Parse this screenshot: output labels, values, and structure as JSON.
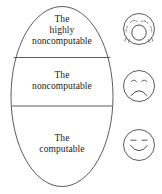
{
  "figure": {
    "stroke_color": "#4a4a4a",
    "text_color": "#1a1a1a",
    "background_color": "#ffffff"
  },
  "ellipse": {
    "bands": [
      {
        "id": "highly-noncomputable",
        "label": "The\nhighly\nnoncomputable",
        "face": "distressed-face"
      },
      {
        "id": "noncomputable",
        "label": "The\nnoncomputable",
        "face": "sad-face"
      },
      {
        "id": "computable",
        "label": "The\ncomputable",
        "face": "happy-face"
      }
    ]
  },
  "faces": {
    "top": {
      "name": "distressed-face",
      "description": "crying face with wide open mouth and tear drops"
    },
    "middle": {
      "name": "sad-face",
      "description": "frowning face"
    },
    "bottom": {
      "name": "happy-face",
      "description": "smiling face"
    }
  }
}
